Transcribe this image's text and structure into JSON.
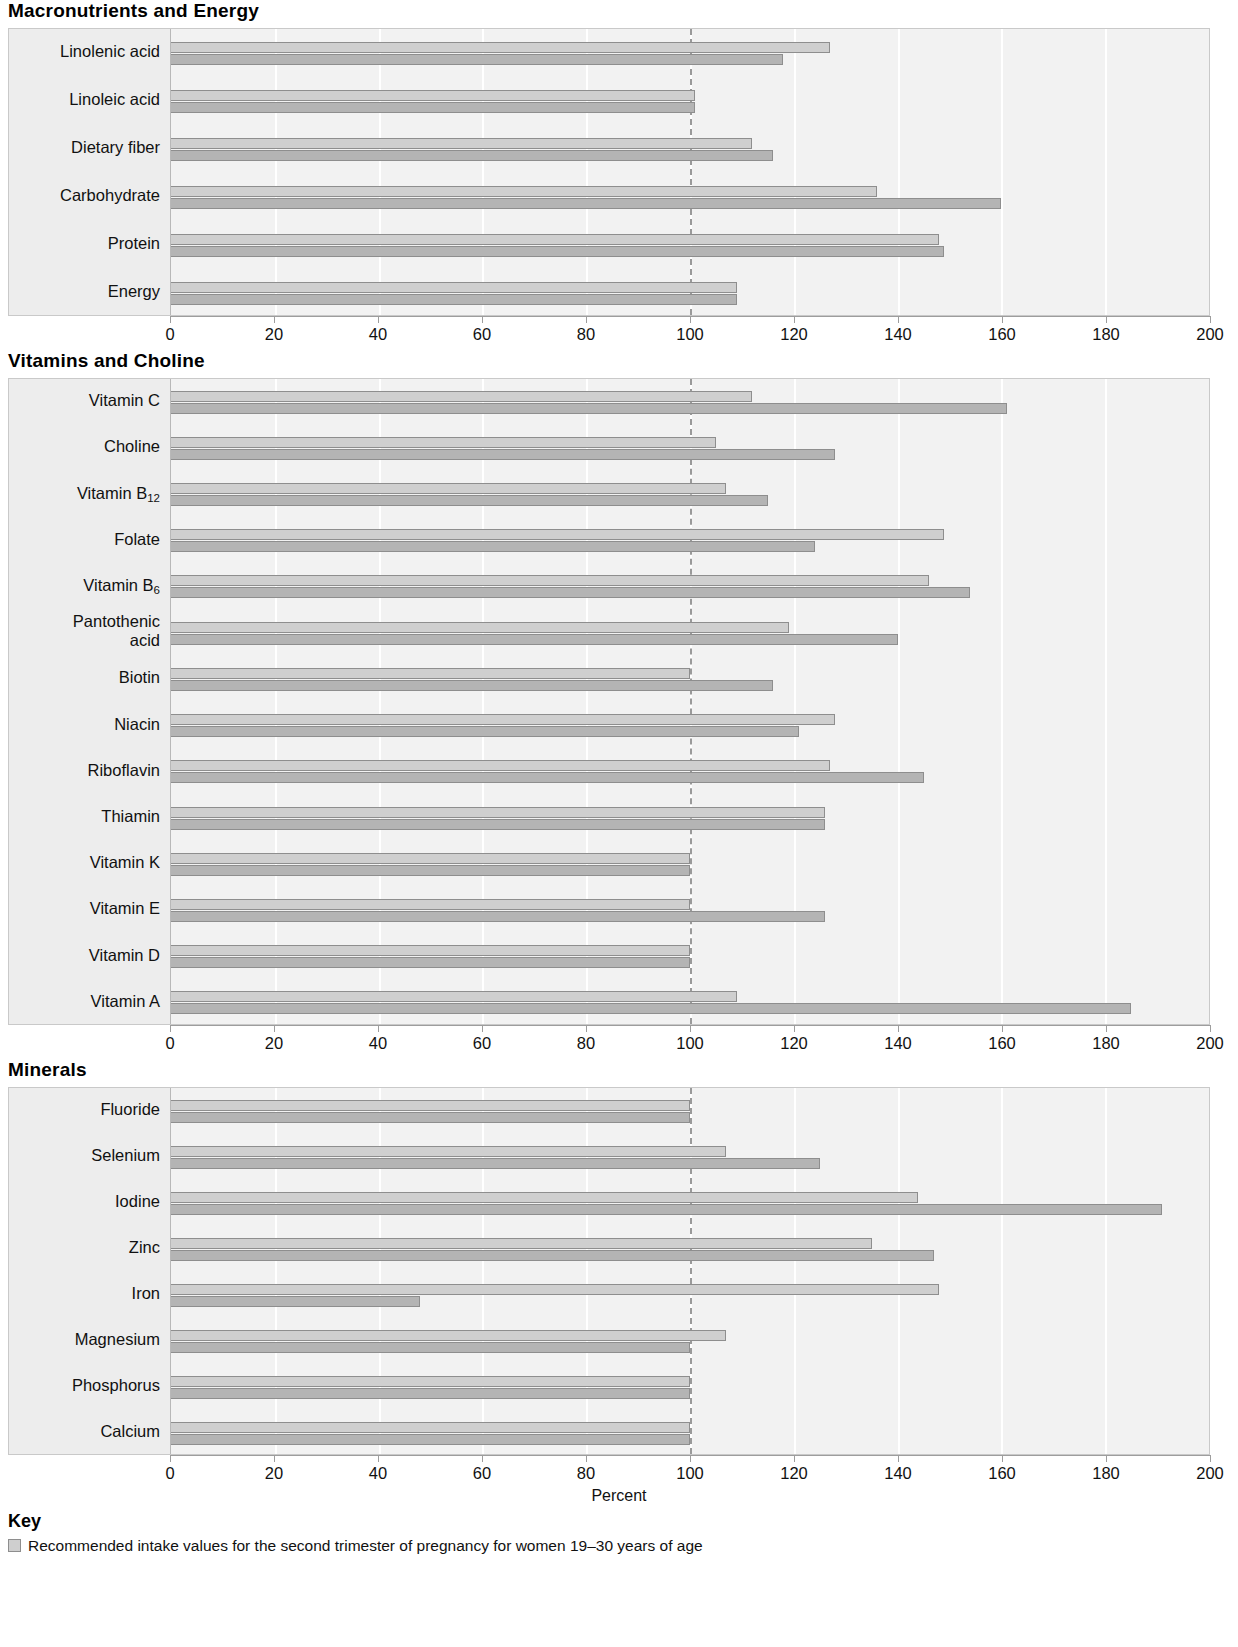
{
  "chart_data": [
    {
      "type": "bar",
      "title": "Macronutrients and Energy",
      "orientation": "horizontal",
      "xlabel": "",
      "ylabel": "",
      "xlim": [
        0,
        200
      ],
      "xticks": [
        0,
        20,
        40,
        60,
        80,
        100,
        120,
        140,
        160,
        180,
        200
      ],
      "reference_line": 100,
      "grid": true,
      "categories": [
        "Linolenic acid",
        "Linoleic acid",
        "Dietary fiber",
        "Carbohydrate",
        "Protein",
        "Energy"
      ],
      "series": [
        {
          "name": "Recommended intake values for the second trimester of pregnancy",
          "values": [
            127,
            101,
            112,
            136,
            148,
            109
          ]
        },
        {
          "name": "Recommended intake values for lactation",
          "values": [
            118,
            101,
            116,
            160,
            149,
            109
          ]
        }
      ]
    },
    {
      "type": "bar",
      "title": "Vitamins and Choline",
      "orientation": "horizontal",
      "xlabel": "",
      "ylabel": "",
      "xlim": [
        0,
        200
      ],
      "xticks": [
        0,
        20,
        40,
        60,
        80,
        100,
        120,
        140,
        160,
        180,
        200
      ],
      "reference_line": 100,
      "grid": true,
      "categories": [
        "Vitamin C",
        "Choline",
        "Vitamin B12",
        "Folate",
        "Vitamin B6",
        "Pantothenic acid",
        "Biotin",
        "Niacin",
        "Riboflavin",
        "Thiamin",
        "Vitamin K",
        "Vitamin E",
        "Vitamin D",
        "Vitamin A"
      ],
      "categories_display": [
        "Vitamin C",
        "Choline",
        "Vitamin B₁₂",
        "Folate",
        "Vitamin B₆",
        "Pantothenic\nacid",
        "Biotin",
        "Niacin",
        "Riboflavin",
        "Thiamin",
        "Vitamin K",
        "Vitamin E",
        "Vitamin D",
        "Vitamin A"
      ],
      "series": [
        {
          "name": "Recommended intake values for the second trimester of pregnancy",
          "values": [
            112,
            105,
            107,
            149,
            146,
            119,
            100,
            128,
            127,
            126,
            100,
            100,
            100,
            109
          ]
        },
        {
          "name": "Recommended intake values for lactation",
          "values": [
            161,
            128,
            115,
            124,
            154,
            140,
            116,
            121,
            145,
            126,
            100,
            126,
            100,
            185
          ]
        }
      ]
    },
    {
      "type": "bar",
      "title": "Minerals",
      "orientation": "horizontal",
      "xlabel": "Percent",
      "ylabel": "",
      "xlim": [
        0,
        200
      ],
      "xticks": [
        0,
        20,
        40,
        60,
        80,
        100,
        120,
        140,
        160,
        180,
        200
      ],
      "reference_line": 100,
      "grid": true,
      "categories": [
        "Fluoride",
        "Selenium",
        "Iodine",
        "Zinc",
        "Iron",
        "Magnesium",
        "Phosphorus",
        "Calcium"
      ],
      "series": [
        {
          "name": "Recommended intake values for the second trimester of pregnancy",
          "values": [
            100,
            107,
            144,
            135,
            148,
            107,
            100,
            100
          ]
        },
        {
          "name": "Recommended intake values for lactation",
          "values": [
            100,
            125,
            191,
            147,
            48,
            100,
            100,
            100
          ]
        }
      ]
    }
  ],
  "sections": [
    {
      "id": "macro",
      "title": "Macronutrients and Energy"
    },
    {
      "id": "vitamins",
      "title": "Vitamins and Choline"
    },
    {
      "id": "minerals",
      "title": "Minerals"
    }
  ],
  "axis": {
    "ticks": [
      "0",
      "20",
      "40",
      "60",
      "80",
      "100",
      "120",
      "140",
      "160",
      "180",
      "200"
    ],
    "xlabel": "Percent"
  },
  "key": {
    "title": "Key",
    "entry1": "Recommended intake values for the second trimester of pregnancy for women 19–30 years of age"
  },
  "colors": {
    "bar_light": "#cfcfcf",
    "bar_dark": "#b4b4b4",
    "panel_bg": "#f2f2f2",
    "label_bg": "#ededed",
    "border": "#c9c9c9",
    "reference": "#9a9a9a"
  }
}
